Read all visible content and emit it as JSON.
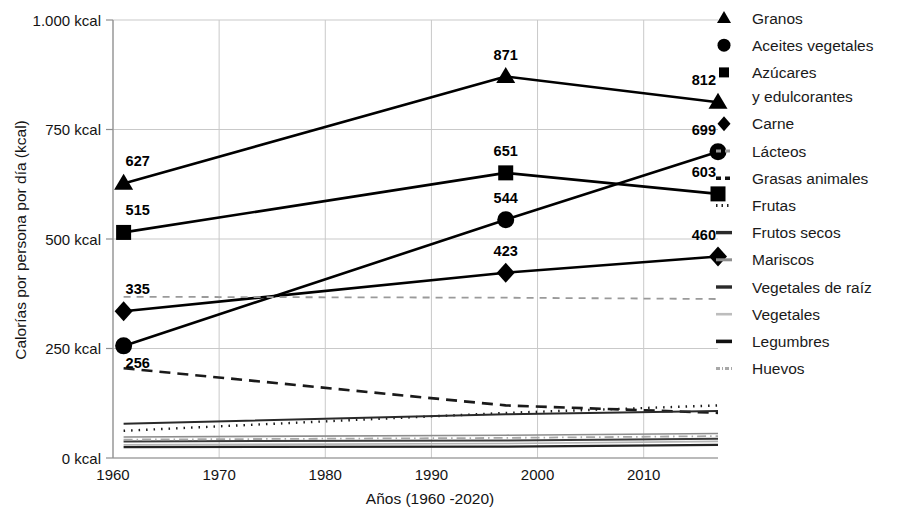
{
  "chart_data": {
    "type": "line",
    "title": "",
    "xlabel": "Años (1960 -2020)",
    "ylabel": "Calorías por persona por día (kcal)",
    "xlim": [
      1960,
      2017
    ],
    "ylim": [
      0,
      1000
    ],
    "grid": true,
    "legend_position": "right",
    "x_ticks": [
      "1960",
      "1970",
      "1980",
      "1990",
      "2000",
      "2010"
    ],
    "x_tick_values": [
      1960,
      1970,
      1980,
      1990,
      2000,
      2010
    ],
    "y_ticks": [
      "0 kcal",
      "250 kcal",
      "500 kcal",
      "750 kcal",
      "1.000 kcal"
    ],
    "y_tick_values": [
      0,
      250,
      500,
      750,
      1000
    ],
    "x": [
      1961,
      1997,
      2017
    ],
    "series": [
      {
        "name": "Granos",
        "marker": "triangle",
        "style": "solid",
        "color": "#000000",
        "width": 2.6,
        "values": [
          627,
          871,
          812
        ],
        "labels": [
          "627",
          "871",
          "812"
        ]
      },
      {
        "name": "Aceites vegetales",
        "marker": "circle",
        "style": "solid",
        "color": "#000000",
        "width": 2.6,
        "values": [
          256,
          544,
          699
        ],
        "labels": [
          "256",
          "544",
          "699"
        ]
      },
      {
        "name": "Azúcares y edulcorantes",
        "marker": "square",
        "style": "solid",
        "color": "#000000",
        "width": 2.6,
        "values": [
          515,
          651,
          603
        ],
        "labels": [
          "515",
          "651",
          "603"
        ]
      },
      {
        "name": "Carne",
        "marker": "diamond",
        "style": "solid",
        "color": "#000000",
        "width": 2.6,
        "values": [
          335,
          423,
          460
        ],
        "labels": [
          "335",
          "423",
          "460"
        ]
      },
      {
        "name": "Lácteos",
        "marker": "none",
        "style": "dashed",
        "color": "#9a9a9a",
        "width": 1.8,
        "values": [
          368,
          366,
          363
        ],
        "labels": []
      },
      {
        "name": "Grasas animales",
        "marker": "none",
        "style": "dashed",
        "color": "#1a1a1a",
        "width": 2.6,
        "values": [
          205,
          120,
          103
        ],
        "labels": []
      },
      {
        "name": "Frutas",
        "marker": "none",
        "style": "dotted",
        "color": "#1a1a1a",
        "width": 2.4,
        "values": [
          62,
          103,
          120
        ],
        "labels": []
      },
      {
        "name": "Frutos secos",
        "marker": "none",
        "style": "solid",
        "color": "#2a2a2a",
        "width": 2.0,
        "values": [
          78,
          100,
          107
        ],
        "labels": []
      },
      {
        "name": "Mariscos",
        "marker": "none",
        "style": "solid",
        "color": "#8d8d8d",
        "width": 1.6,
        "values": [
          48,
          52,
          56
        ],
        "labels": []
      },
      {
        "name": "Vegetales de raíz",
        "marker": "none",
        "style": "solid",
        "color": "#3a3a3a",
        "width": 2.0,
        "values": [
          38,
          40,
          44
        ],
        "labels": []
      },
      {
        "name": "Vegetales",
        "marker": "none",
        "style": "solid",
        "color": "#b5b5b5",
        "width": 1.6,
        "values": [
          30,
          33,
          38
        ],
        "labels": []
      },
      {
        "name": "Legumbres",
        "marker": "none",
        "style": "solid",
        "color": "#222222",
        "width": 2.2,
        "values": [
          25,
          26,
          30
        ],
        "labels": []
      },
      {
        "name": "Huevos",
        "marker": "none",
        "style": "dashdot",
        "color": "#a8a8a8",
        "width": 1.8,
        "values": [
          42,
          46,
          50
        ],
        "labels": []
      }
    ]
  },
  "legend": {
    "items": [
      {
        "label": "Granos",
        "glyph": "triangle"
      },
      {
        "label": "Aceites vegetales",
        "glyph": "circle"
      },
      {
        "label": "Azúcares",
        "label2": "y edulcorantes",
        "glyph": "square-small"
      },
      {
        "label": "Carne",
        "glyph": "diamond"
      },
      {
        "label": "Lácteos",
        "glyph": "line-dashed-gray"
      },
      {
        "label": "Grasas animales",
        "glyph": "line-dashed-black"
      },
      {
        "label": "Frutas",
        "glyph": "line-dotted"
      },
      {
        "label": "Frutos secos",
        "glyph": "line-solid-dark"
      },
      {
        "label": "Mariscos",
        "glyph": "line-solid-gray"
      },
      {
        "label": "Vegetales de raíz",
        "glyph": "line-solid-dark"
      },
      {
        "label": "Vegetales",
        "glyph": "line-solid-light"
      },
      {
        "label": "Legumbres",
        "glyph": "line-solid-black"
      },
      {
        "label": "Huevos",
        "glyph": "line-dashdot-gray"
      }
    ]
  },
  "colors": {
    "axis": "#8f8f8f",
    "grid": "#c9c9c9",
    "text": "#141414",
    "data": "#000000"
  }
}
